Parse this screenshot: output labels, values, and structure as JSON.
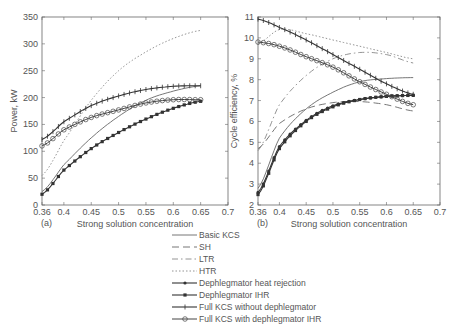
{
  "chart_data": [
    {
      "type": "line",
      "panel_label": "(a)",
      "title": "",
      "xlabel": "Strong solution concentration",
      "ylabel": "Power, kW",
      "xlim": [
        0.35,
        0.7
      ],
      "ylim": [
        0,
        350
      ],
      "xticks": [
        "0.36",
        "0.4",
        "0.45",
        "0.5",
        "0.55",
        "0.6",
        "0.65",
        "0.7"
      ],
      "yticks": [
        "0",
        "50",
        "100",
        "150",
        "200",
        "250",
        "300",
        "350"
      ],
      "grid": false,
      "x": [
        0.36,
        0.4,
        0.45,
        0.5,
        0.55,
        0.6,
        0.65
      ],
      "series": [
        {
          "name": "Basic KCS",
          "values": [
            25,
            75,
            125,
            165,
            195,
            212,
            222
          ]
        },
        {
          "name": "HTR",
          "values": [
            55,
            120,
            195,
            250,
            285,
            310,
            325
          ]
        },
        {
          "name": "Dephlegmator IHR",
          "values": [
            20,
            65,
            105,
            135,
            160,
            180,
            193
          ]
        },
        {
          "name": "Full KCS without dephlegmator",
          "values": [
            122,
            155,
            185,
            203,
            215,
            221,
            222
          ]
        },
        {
          "name": "Full KCS with dephlegmator IHR",
          "values": [
            110,
            140,
            163,
            177,
            190,
            196,
            196
          ]
        }
      ]
    },
    {
      "type": "line",
      "panel_label": "(b)",
      "title": "",
      "xlabel": "Strong solution concentration",
      "ylabel": "Cycle efficiency, %",
      "xlim": [
        0.35,
        0.7
      ],
      "ylim": [
        2,
        11
      ],
      "xticks": [
        "0.36",
        "0.4",
        "0.45",
        "0.5",
        "0.55",
        "0.6",
        "0.65",
        "0.7"
      ],
      "yticks": [
        "2",
        "3",
        "4",
        "5",
        "6",
        "7",
        "8",
        "9",
        "10",
        "11"
      ],
      "grid": false,
      "x": [
        0.36,
        0.4,
        0.45,
        0.5,
        0.55,
        0.6,
        0.65
      ],
      "series": [
        {
          "name": "Basic KCS",
          "values": [
            2.8,
            5.2,
            6.6,
            7.4,
            7.9,
            8.05,
            8.1
          ]
        },
        {
          "name": "SH",
          "values": [
            4.7,
            5.9,
            6.6,
            6.9,
            6.95,
            6.8,
            6.5
          ]
        },
        {
          "name": "LTR",
          "values": [
            4.6,
            6.8,
            8.2,
            9.0,
            9.3,
            9.2,
            8.8
          ]
        },
        {
          "name": "HTR",
          "values": [
            9.7,
            10.4,
            10.2,
            9.9,
            9.6,
            9.3,
            9.0
          ]
        },
        {
          "name": "Dephlegmator heat rejection",
          "values": [
            2.6,
            4.8,
            6.05,
            6.75,
            7.05,
            7.2,
            7.25
          ]
        },
        {
          "name": "Dephlegmator IHR",
          "values": [
            2.5,
            4.7,
            6.0,
            6.7,
            7.05,
            7.2,
            7.25
          ]
        },
        {
          "name": "Full KCS without dephlegmator",
          "values": [
            10.9,
            10.5,
            9.9,
            9.2,
            8.5,
            7.8,
            7.3
          ]
        },
        {
          "name": "Full KCS with dephlegmator IHR",
          "values": [
            9.8,
            9.6,
            9.1,
            8.6,
            7.9,
            7.3,
            6.8
          ]
        }
      ]
    }
  ],
  "legend": {
    "items": [
      {
        "label": "Basic KCS",
        "style": "solid"
      },
      {
        "label": "SH",
        "style": "dashed"
      },
      {
        "label": "LTR",
        "style": "dashdot"
      },
      {
        "label": "HTR",
        "style": "dotted"
      },
      {
        "label": "Dephlegmator heat rejection",
        "style": "solid-dot"
      },
      {
        "label": "Dephlegmator IHR",
        "style": "solid-square"
      },
      {
        "label": "Full KCS without dephlegmator",
        "style": "solid-plus"
      },
      {
        "label": "Full KCS with dephlegmator IHR",
        "style": "solid-circle"
      }
    ]
  },
  "colors": {
    "axis": "#555555",
    "line": "#444444",
    "light_line": "#888888"
  }
}
